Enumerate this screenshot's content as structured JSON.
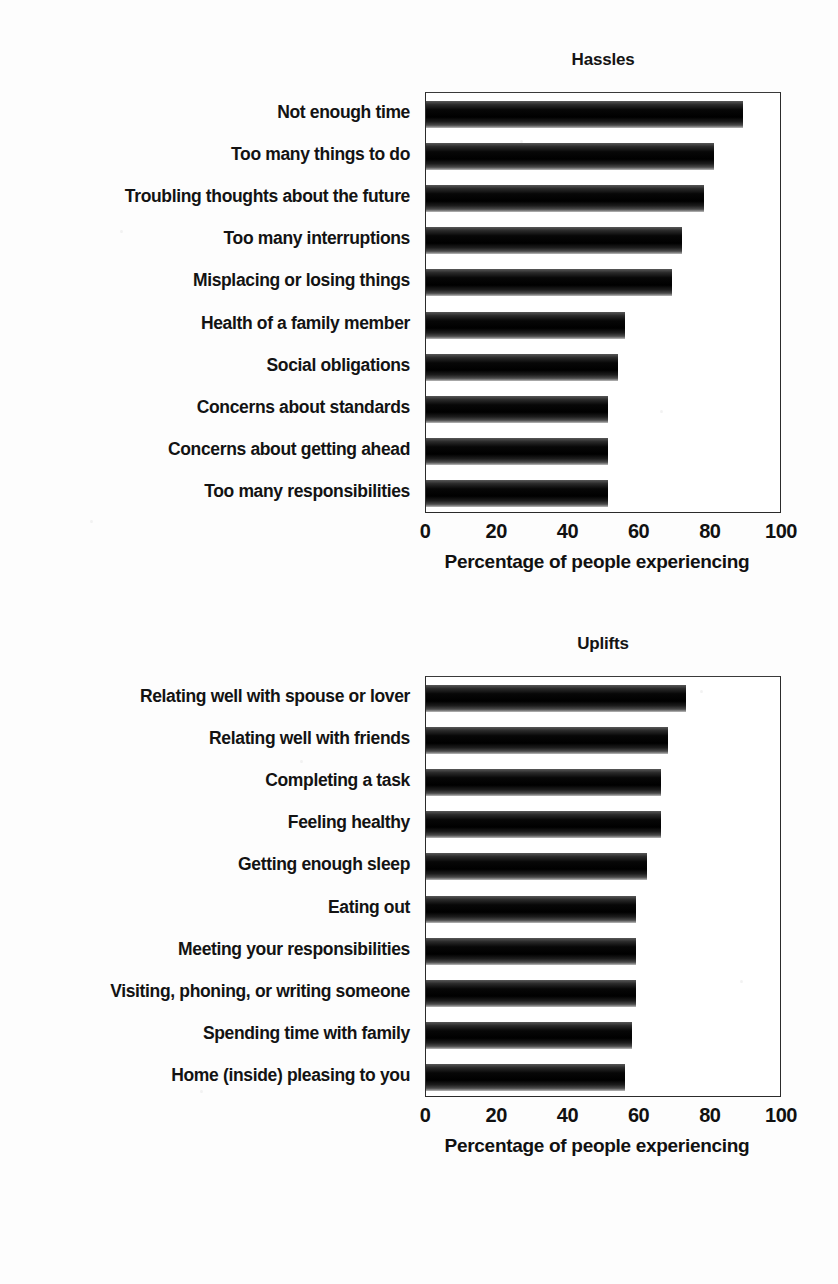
{
  "figure": {
    "background_color": "#fdfdfd",
    "bar_color": "#0a0a0a",
    "axis_color": "#2b2b2b"
  },
  "chart_data": [
    {
      "type": "bar",
      "orientation": "horizontal",
      "title": "Hassles",
      "xlabel": "Percentage of people experiencing",
      "ylabel": "",
      "xlim": [
        0,
        100
      ],
      "xticks": [
        0,
        20,
        40,
        60,
        80,
        100
      ],
      "xtick_labels": [
        "0",
        "20",
        "40",
        "60",
        "80",
        "100"
      ],
      "grid": false,
      "legend": false,
      "categories": [
        "Not enough time",
        "Too many things to do",
        "Troubling thoughts about the future",
        "Too many interruptions",
        "Misplacing or losing things",
        "Health of a family member",
        "Social obligations",
        "Concerns about standards",
        "Concerns about getting ahead",
        "Too many responsibilities"
      ],
      "values": [
        89,
        81,
        78,
        72,
        69,
        56,
        54,
        51,
        51,
        51
      ]
    },
    {
      "type": "bar",
      "orientation": "horizontal",
      "title": "Uplifts",
      "xlabel": "Percentage of people experiencing",
      "ylabel": "",
      "xlim": [
        0,
        100
      ],
      "xticks": [
        0,
        20,
        40,
        60,
        80,
        100
      ],
      "xtick_labels": [
        "0",
        "20",
        "40",
        "60",
        "80",
        "100"
      ],
      "grid": false,
      "legend": false,
      "categories": [
        "Relating well with spouse or lover",
        "Relating well with friends",
        "Completing a task",
        "Feeling healthy",
        "Getting enough sleep",
        "Eating out",
        "Meeting your responsibilities",
        "Visiting, phoning, or writing someone",
        "Spending time with family",
        "Home (inside) pleasing to you"
      ],
      "values": [
        73,
        68,
        66,
        66,
        62,
        59,
        59,
        59,
        58,
        56
      ]
    }
  ],
  "caption_fragment": ""
}
